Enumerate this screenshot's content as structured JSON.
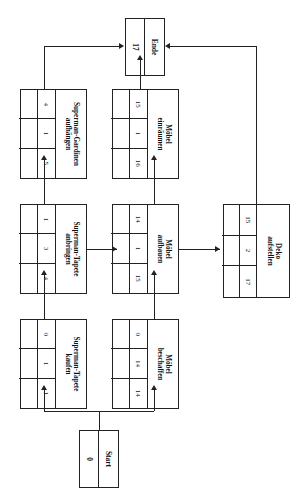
{
  "diagram": {
    "orientation": "rotated-90-ccw",
    "type": "project-network-diagram",
    "cell_legend": [
      "FAZ",
      "Dauer",
      "FEZ"
    ],
    "line_color": "#222222",
    "box_fill": "#ffffff"
  },
  "nodes": {
    "start": {
      "label": "Start",
      "value": "0"
    },
    "ende": {
      "label": "Ende",
      "value": "17"
    },
    "tapete_kaufen": {
      "label_line1": "Superman-Tapete",
      "label_line2": "kaufen",
      "cells": [
        "0",
        "1",
        "1",
        "",
        "",
        ""
      ]
    },
    "tapete_anbringen": {
      "label_line1": "Superman-Tapete",
      "label_line2": "anbringen",
      "cells": [
        "1",
        "3",
        "4",
        "",
        "",
        ""
      ]
    },
    "gardinen_aufhaengen": {
      "label_line1": "Superman-Gardinen",
      "label_line2": "aufhängen",
      "cells": [
        "4",
        "1",
        "5",
        "",
        "",
        ""
      ]
    },
    "moebel_beschaffen": {
      "label_line1": "Möbel",
      "label_line2": "beschaffen",
      "cells": [
        "0",
        "14",
        "14",
        "",
        "",
        ""
      ]
    },
    "moebel_aufbauen": {
      "label_line1": "Möbel",
      "label_line2": "aufbauen",
      "cells": [
        "14",
        "1",
        "15",
        "",
        "",
        ""
      ]
    },
    "moebel_einraeumen": {
      "label_line1": "Möbel",
      "label_line2": "einräumen",
      "cells": [
        "15",
        "1",
        "16",
        "",
        "",
        ""
      ]
    },
    "deko_aufstellen": {
      "label_line1": "Deko",
      "label_line2": "aufstellen",
      "cells": [
        "15",
        "2",
        "17",
        "",
        "",
        ""
      ]
    }
  },
  "edges": [
    {
      "from": "start",
      "to": "tapete_kaufen"
    },
    {
      "from": "start",
      "to": "moebel_beschaffen"
    },
    {
      "from": "tapete_kaufen",
      "to": "tapete_anbringen"
    },
    {
      "from": "tapete_anbringen",
      "to": "gardinen_aufhaengen"
    },
    {
      "from": "tapete_anbringen",
      "to": "moebel_aufbauen"
    },
    {
      "from": "moebel_beschaffen",
      "to": "moebel_aufbauen"
    },
    {
      "from": "moebel_aufbauen",
      "to": "moebel_einraeumen"
    },
    {
      "from": "moebel_aufbauen",
      "to": "deko_aufstellen"
    },
    {
      "from": "gardinen_aufhaengen",
      "to": "ende"
    },
    {
      "from": "moebel_einraeumen",
      "to": "ende"
    },
    {
      "from": "deko_aufstellen",
      "to": "ende"
    }
  ]
}
